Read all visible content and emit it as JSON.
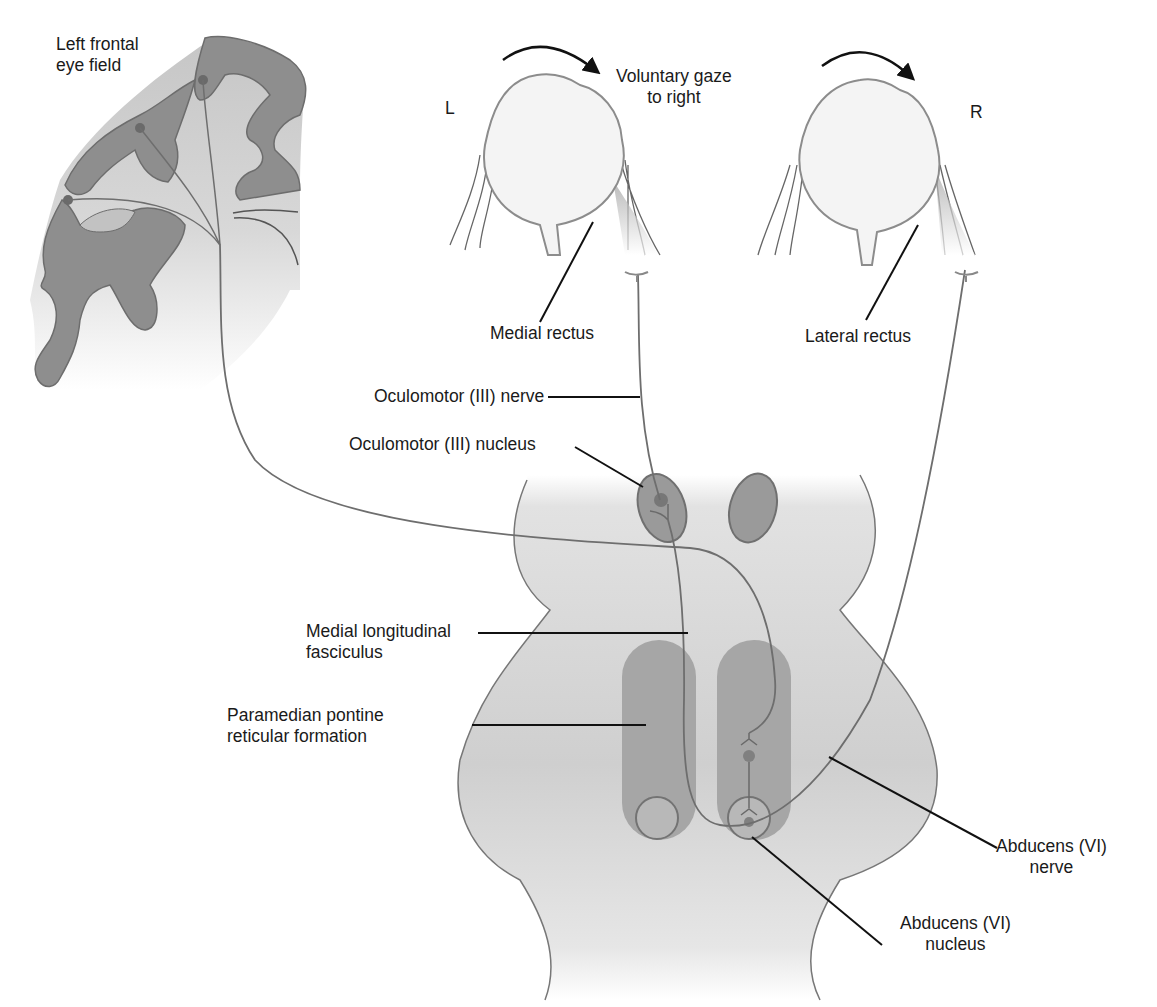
{
  "labels": {
    "frontal_eye_field": [
      "Left frontal",
      "eye field"
    ],
    "voluntary_gaze": [
      "Voluntary gaze",
      "to right"
    ],
    "left_eye": "L",
    "right_eye": "R",
    "medial_rectus": "Medial rectus",
    "lateral_rectus": "Lateral rectus",
    "oculomotor_nerve": "Oculomotor (III) nerve",
    "oculomotor_nucleus": "Oculomotor (III) nucleus",
    "mlf": [
      "Medial longitudinal",
      "fasciculus"
    ],
    "pprf": [
      "Paramedian pontine",
      "reticular formation"
    ],
    "abducens_nerve": [
      "Abducens (VI)",
      "nerve"
    ],
    "abducens_nucleus": [
      "Abducens (VI)",
      "nucleus"
    ]
  },
  "colors": {
    "cortex_dark": "#8a8a8a",
    "cortex_light": "#c4c4c4",
    "brainstem_fill": "#d2d2d2",
    "nucleus_fill": "#9a9a9a",
    "column_fill": "#a8a8a8",
    "pathway_stroke": "#6e6e6e",
    "leader_line": "#111111",
    "eye_fill": "#f3f3f3",
    "eye_stroke": "#8c8c8c"
  }
}
